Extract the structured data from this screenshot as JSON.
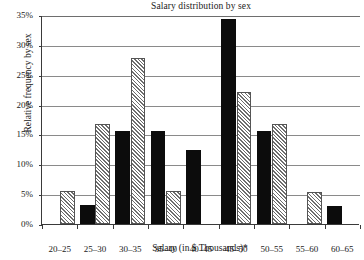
{
  "chart_data": {
    "type": "bar",
    "title": "Salary distribution by sex",
    "xlabel": "Salary (in $ Thousands)*",
    "ylabel": "Relative frequency by sex",
    "categories": [
      "20–25",
      "25–30",
      "30–35",
      "35–40",
      "40–45",
      "45–50",
      "50–55",
      "55–60",
      "60–65"
    ],
    "series": [
      {
        "name": "solid-black-series",
        "fill": "solid",
        "color": "#0c0c0c",
        "values": [
          null,
          3.2,
          15.6,
          15.6,
          12.4,
          34.4,
          15.5,
          null,
          3.1
        ]
      },
      {
        "name": "hatched-gray-series",
        "fill": "hatched",
        "color": "#6d6d6d",
        "values": [
          5.5,
          16.7,
          27.8,
          5.5,
          null,
          22.1,
          16.7,
          5.4,
          null
        ]
      }
    ],
    "ylim": [
      0,
      35
    ],
    "ytick_values": [
      0,
      5,
      10,
      15,
      20,
      25,
      30,
      35
    ],
    "ytick_labels": [
      "0%",
      "5%",
      "10%",
      "15%",
      "20%",
      "25%",
      "30%",
      "35%"
    ],
    "grid": true,
    "grid_axis": "y",
    "legend": null,
    "legend_position": "none",
    "annotations": []
  }
}
